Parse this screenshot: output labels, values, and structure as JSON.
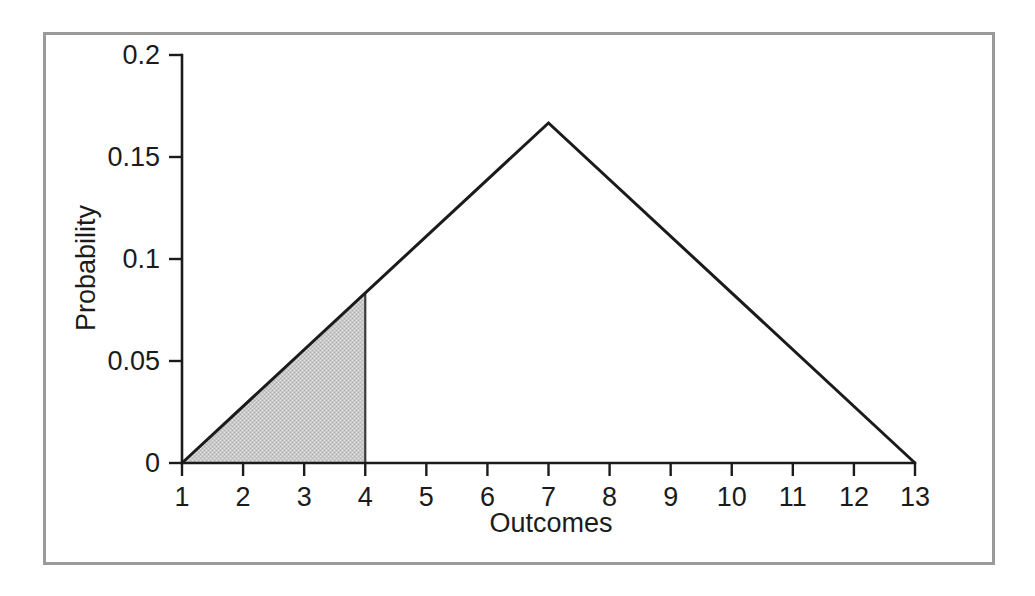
{
  "figure": {
    "frame_color": "#9a9a9a",
    "background_color": "#ffffff",
    "line_color": "#1b1b1b"
  },
  "chart_data": {
    "type": "line",
    "title": "",
    "subtitle": "",
    "xlabel": "Outcomes",
    "ylabel": "Probability",
    "grid": false,
    "legend": false,
    "xlim": [
      1,
      13
    ],
    "ylim": [
      0,
      0.2
    ],
    "x_ticks": [
      1,
      2,
      3,
      4,
      5,
      6,
      7,
      8,
      9,
      10,
      11,
      12,
      13
    ],
    "x_tick_labels": [
      "1",
      "2",
      "3",
      "4",
      "5",
      "6",
      "7",
      "8",
      "9",
      "10",
      "11",
      "12",
      "13"
    ],
    "y_ticks": [
      0,
      0.05,
      0.1,
      0.15,
      0.2
    ],
    "y_tick_labels": [
      "0",
      "0.05",
      "0.1",
      "0.15",
      "0.2"
    ],
    "series": [
      {
        "name": "Probability distribution of sum of two dice",
        "x": [
          1,
          7,
          13
        ],
        "values": [
          0,
          0.1667,
          0
        ]
      }
    ],
    "annotations": [
      {
        "name": "shaded-area",
        "type": "area-fill",
        "label": "",
        "x_from": 1,
        "x_to": 4,
        "y_at_x_from": 0,
        "y_at_x_to": 0.0833,
        "fill_color": "#c8c8c8"
      }
    ]
  },
  "axis_titles": {
    "x": "Outcomes",
    "y": "Probability"
  }
}
